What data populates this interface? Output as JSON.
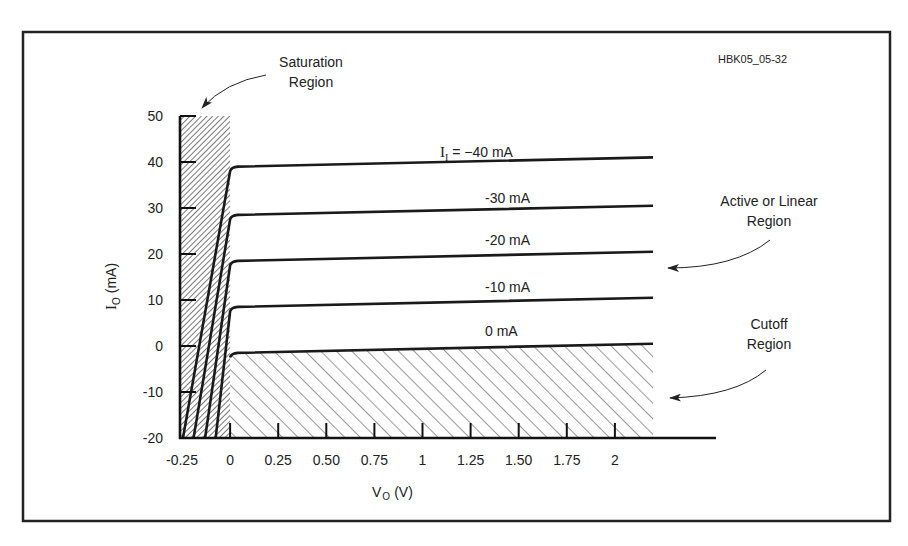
{
  "figure_id": "HBK05_05-32",
  "annotations": {
    "saturation": [
      "Saturation",
      "Region"
    ],
    "active": [
      "Active or Linear",
      "Region"
    ],
    "cutoff": [
      "Cutoff",
      "Region"
    ]
  },
  "axes": {
    "ylabel_main": "I",
    "ylabel_sub": "O",
    "ylabel_unit": "(mA)",
    "xlabel_main": "V",
    "xlabel_sub": "O",
    "xlabel_unit": "(V)"
  },
  "colors": {
    "ink": "#1a1a1a",
    "hatch": "#333333",
    "background": "#ffffff"
  },
  "chart_data": {
    "type": "line",
    "title": "",
    "xlabel": "V_O (V)",
    "ylabel": "I_O (mA)",
    "xlim": [
      -0.25,
      2.2
    ],
    "ylim": [
      -20,
      50
    ],
    "x_ticks": [
      -0.25,
      0,
      0.25,
      0.5,
      0.75,
      1,
      1.25,
      1.5,
      1.75,
      2
    ],
    "x_tick_labels": [
      "-0.25",
      "0",
      "0.25",
      "0.50",
      "0.75",
      "1",
      "1.25",
      "1.50",
      "1.75",
      "2"
    ],
    "y_ticks": [
      50,
      40,
      30,
      20,
      10,
      0,
      -10,
      -20
    ],
    "y_tick_labels": [
      "50",
      "40",
      "30",
      "20",
      "10",
      "0",
      "-10",
      "-20"
    ],
    "grid": false,
    "legend": "inline curve labels",
    "series": [
      {
        "name": "I_I = -40 mA",
        "label_prefix": "I",
        "label_sub": "I",
        "label": " = −40 mA",
        "points": [
          [
            -0.245,
            -20
          ],
          [
            0,
            38
          ],
          [
            0.03,
            39
          ],
          [
            2.2,
            41
          ]
        ]
      },
      {
        "name": "-30 mA",
        "label": "-30 mA",
        "points": [
          [
            -0.19,
            -20
          ],
          [
            0,
            27.5
          ],
          [
            0.03,
            28.5
          ],
          [
            2.2,
            30.5
          ]
        ]
      },
      {
        "name": "-20 mA",
        "label": "-20 mA",
        "points": [
          [
            -0.13,
            -20
          ],
          [
            0,
            17.5
          ],
          [
            0.03,
            18.5
          ],
          [
            2.2,
            20.5
          ]
        ]
      },
      {
        "name": "-10 mA",
        "label": "-10 mA",
        "points": [
          [
            -0.075,
            -20
          ],
          [
            0,
            7.5
          ],
          [
            0.03,
            8.5
          ],
          [
            2.2,
            10.5
          ]
        ]
      },
      {
        "name": "0 mA",
        "label": "0 mA",
        "points": [
          [
            0,
            -2.5
          ],
          [
            0.03,
            -1.5
          ],
          [
            2.2,
            0.5
          ]
        ]
      }
    ],
    "regions": [
      {
        "name": "Saturation Region",
        "x": [
          -0.25,
          0
        ],
        "y": [
          -20,
          50
        ],
        "hatch": "dense"
      },
      {
        "name": "Active or Linear Region",
        "x": [
          0,
          2.2
        ],
        "y": [
          0,
          40
        ]
      },
      {
        "name": "Cutoff Region",
        "x": [
          0,
          2.2
        ],
        "y": [
          -20,
          0
        ],
        "hatch": "sparse"
      }
    ]
  }
}
